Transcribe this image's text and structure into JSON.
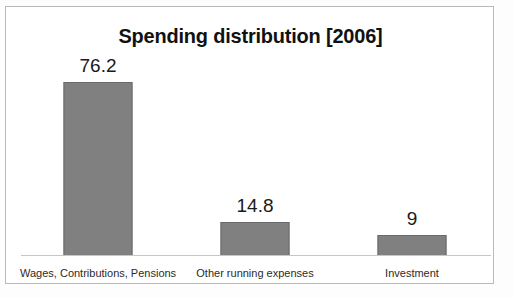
{
  "chart_data": {
    "type": "bar",
    "title": "Spending distribution [2006]",
    "subtitle": "",
    "xlabel": "",
    "ylabel": "",
    "categories": [
      "Wages, Contributions, Pensions",
      "Other running expenses",
      "Investment"
    ],
    "values": [
      76.2,
      14.8,
      9
    ],
    "value_labels": [
      "76.2",
      "14.8",
      "9"
    ],
    "series": [
      {
        "name": "Spending distribution [2006]",
        "values": [
          76.2,
          14.8,
          9
        ]
      }
    ],
    "ylim": [
      0,
      85
    ],
    "grid": false,
    "legend": false,
    "legend_position": "none",
    "axis_ticks_visible": false,
    "data_labels_shown": true,
    "bar_color": "#808080",
    "bar_border_color": "#6b6b6b",
    "axis_line_color": "#c6c6c6",
    "frame_color": "#b9b9b9",
    "background_color": "#ffffff",
    "title_color": "#111111",
    "label_color": "#2b2b2b"
  },
  "figure": {
    "title": "Spending distribution [2006]",
    "frame_label": "chart-frame"
  }
}
